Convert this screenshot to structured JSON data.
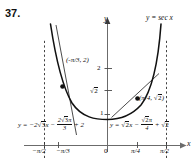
{
  "figure": {
    "problem_number": "37.",
    "axes": {
      "x_axis_label": "x",
      "y_axis_label": "y"
    },
    "x_ticks": [
      {
        "label": "-π/2",
        "value": -1.5708
      },
      {
        "label": "-π/3",
        "value": -1.0472
      },
      {
        "label": "0",
        "value": 0
      },
      {
        "label": "π/4",
        "value": 0.7854
      },
      {
        "label": "π/2",
        "value": 1.5708
      }
    ],
    "y_ticks": [
      {
        "label": "1",
        "value": 1
      },
      {
        "label": "√2",
        "value": 1.41421
      },
      {
        "label": "2",
        "value": 2
      }
    ],
    "curve": {
      "label": "y = sec x",
      "function": "sec"
    },
    "asymptotes": [
      {
        "label": "-π/2",
        "style": "dashed"
      },
      {
        "label": "π/2",
        "style": "dashed"
      }
    ],
    "points": [
      {
        "label": "(-π/3, 2)",
        "x": -1.0472,
        "y": 2
      },
      {
        "label": "(π/4, √2)",
        "x": 0.7854,
        "y": 1.41421
      }
    ],
    "tangent_lines": [
      {
        "equation_text": "y = -2√3x - 2√3π/3 + 2",
        "slope": -3.4641,
        "at_point": "(-π/3, 2)"
      },
      {
        "equation_text": "y = √2x - √2π/4 + √2",
        "slope": 1.41421,
        "at_point": "(π/4, √2)"
      }
    ],
    "colors": {
      "ink": "#111111",
      "axis": "#555555",
      "background": "#ffffff"
    }
  }
}
